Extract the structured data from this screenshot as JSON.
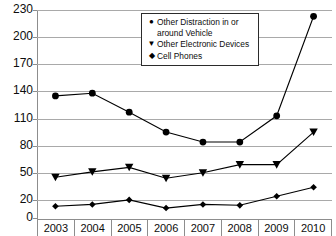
{
  "chart_data": {
    "type": "line",
    "title": "",
    "xlabel": "",
    "ylabel": "",
    "categories": [
      "2003",
      "2004",
      "2005",
      "2006",
      "2007",
      "2008",
      "2009",
      "2010"
    ],
    "x": [
      2003,
      2004,
      2005,
      2006,
      2007,
      2008,
      2009,
      2010
    ],
    "ylim": [
      0,
      230
    ],
    "yticks": [
      0,
      20,
      50,
      80,
      110,
      140,
      170,
      200,
      230
    ],
    "grid": true,
    "legend_position": "top-center",
    "series": [
      {
        "name": "Other Distraction in or around Vehicle",
        "marker": "circle",
        "values": [
          135,
          138,
          117,
          95,
          84,
          84,
          113,
          223
        ]
      },
      {
        "name": "Other Electronic Devices",
        "marker": "triangle-down",
        "values": [
          45,
          51,
          56,
          44,
          50,
          59,
          59,
          95
        ]
      },
      {
        "name": "Cell Phones",
        "marker": "diamond",
        "values": [
          13,
          15,
          20,
          11,
          15,
          14,
          24,
          34
        ]
      }
    ]
  },
  "axis": {
    "y_tick_labels": [
      "230",
      "200",
      "170",
      "140",
      "110",
      "80",
      "50",
      "20",
      "0"
    ],
    "x_tick_labels": [
      "2003",
      "2004",
      "2005",
      "2006",
      "2007",
      "2008",
      "2009",
      "2010"
    ]
  },
  "legend": {
    "items": [
      {
        "marker": "●",
        "label": "Other Distraction in or around Vehicle",
        "icon": "circle-marker-icon"
      },
      {
        "marker": "▼",
        "label": "Other Electronic Devices",
        "icon": "triangle-marker-icon"
      },
      {
        "marker": "◆",
        "label": "Cell Phones",
        "icon": "diamond-marker-icon"
      }
    ]
  },
  "colors": {
    "series_line": "#000000",
    "grid": "#a9a9a9",
    "axis": "#8d8d8d",
    "text": "#0d0d0d",
    "background": "#ffffff"
  }
}
